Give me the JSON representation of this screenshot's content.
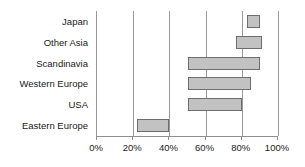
{
  "chart_data": {
    "type": "bar",
    "orientation": "horizontal",
    "subtype": "floating-range-bar",
    "title": "",
    "subtitle": "",
    "xlabel": "",
    "ylabel": "",
    "xlim": [
      0,
      100
    ],
    "xunit": "%",
    "grid": true,
    "legend": false,
    "legend_position": "none",
    "xticks": [
      0,
      20,
      40,
      60,
      80,
      100
    ],
    "xtick_labels": [
      "0%",
      "20%",
      "40%",
      "60%",
      "80%",
      "100%"
    ],
    "categories": [
      "Japan",
      "Other Asia",
      "Scandinavia",
      "Western Europe",
      "USA",
      "Eastern Europe"
    ],
    "bars": [
      {
        "category": "Japan",
        "low": 83,
        "high": 90
      },
      {
        "category": "Other Asia",
        "low": 77,
        "high": 91
      },
      {
        "category": "Scandinavia",
        "low": 50,
        "high": 90
      },
      {
        "category": "Western Europe",
        "low": 50,
        "high": 85
      },
      {
        "category": "USA",
        "low": 50,
        "high": 80
      },
      {
        "category": "Eastern Europe",
        "low": 22,
        "high": 40
      }
    ],
    "colors": {
      "bar_fill": "#c2c2c2",
      "bar_border": "#6d6d6d",
      "gridline": "#9a9a9a",
      "axis": "#8f8f8f",
      "text": "#1a1a1a",
      "background": "#ffffff"
    }
  }
}
